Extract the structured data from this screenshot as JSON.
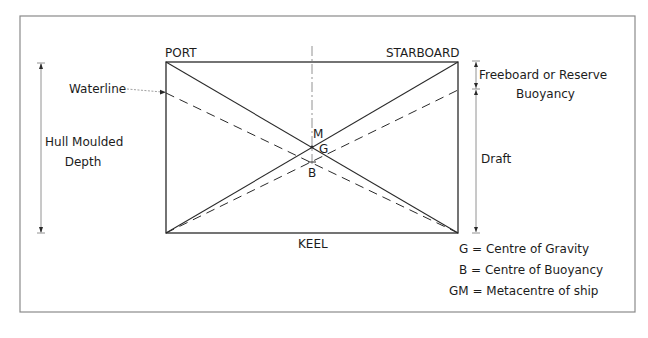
{
  "diagram": {
    "type": "ship-stability-cross-section",
    "hull_labels": {
      "port": "PORT",
      "starboard": "STARBOARD",
      "keel": "KEEL"
    },
    "left_labels": {
      "waterline": "Waterline",
      "hull_depth_line1": "Hull Moulded",
      "hull_depth_line2": "Depth"
    },
    "right_labels": {
      "freeboard_line1": "Freeboard or Reserve",
      "freeboard_line2": "Buoyancy",
      "draft": "Draft"
    },
    "points": {
      "m": "M",
      "g": "G",
      "b": "B"
    },
    "legend": [
      {
        "key": "G",
        "text": "G = Centre of Gravity"
      },
      {
        "key": "B",
        "text": "B = Centre of Buoyancy"
      },
      {
        "key": "GM",
        "text": "GM = Metacentre of ship"
      }
    ],
    "colors": {
      "line": "#2a2a2a",
      "frame": "#8a8a8a",
      "dim_line": "#6a6a6a",
      "background": "#ffffff"
    }
  }
}
